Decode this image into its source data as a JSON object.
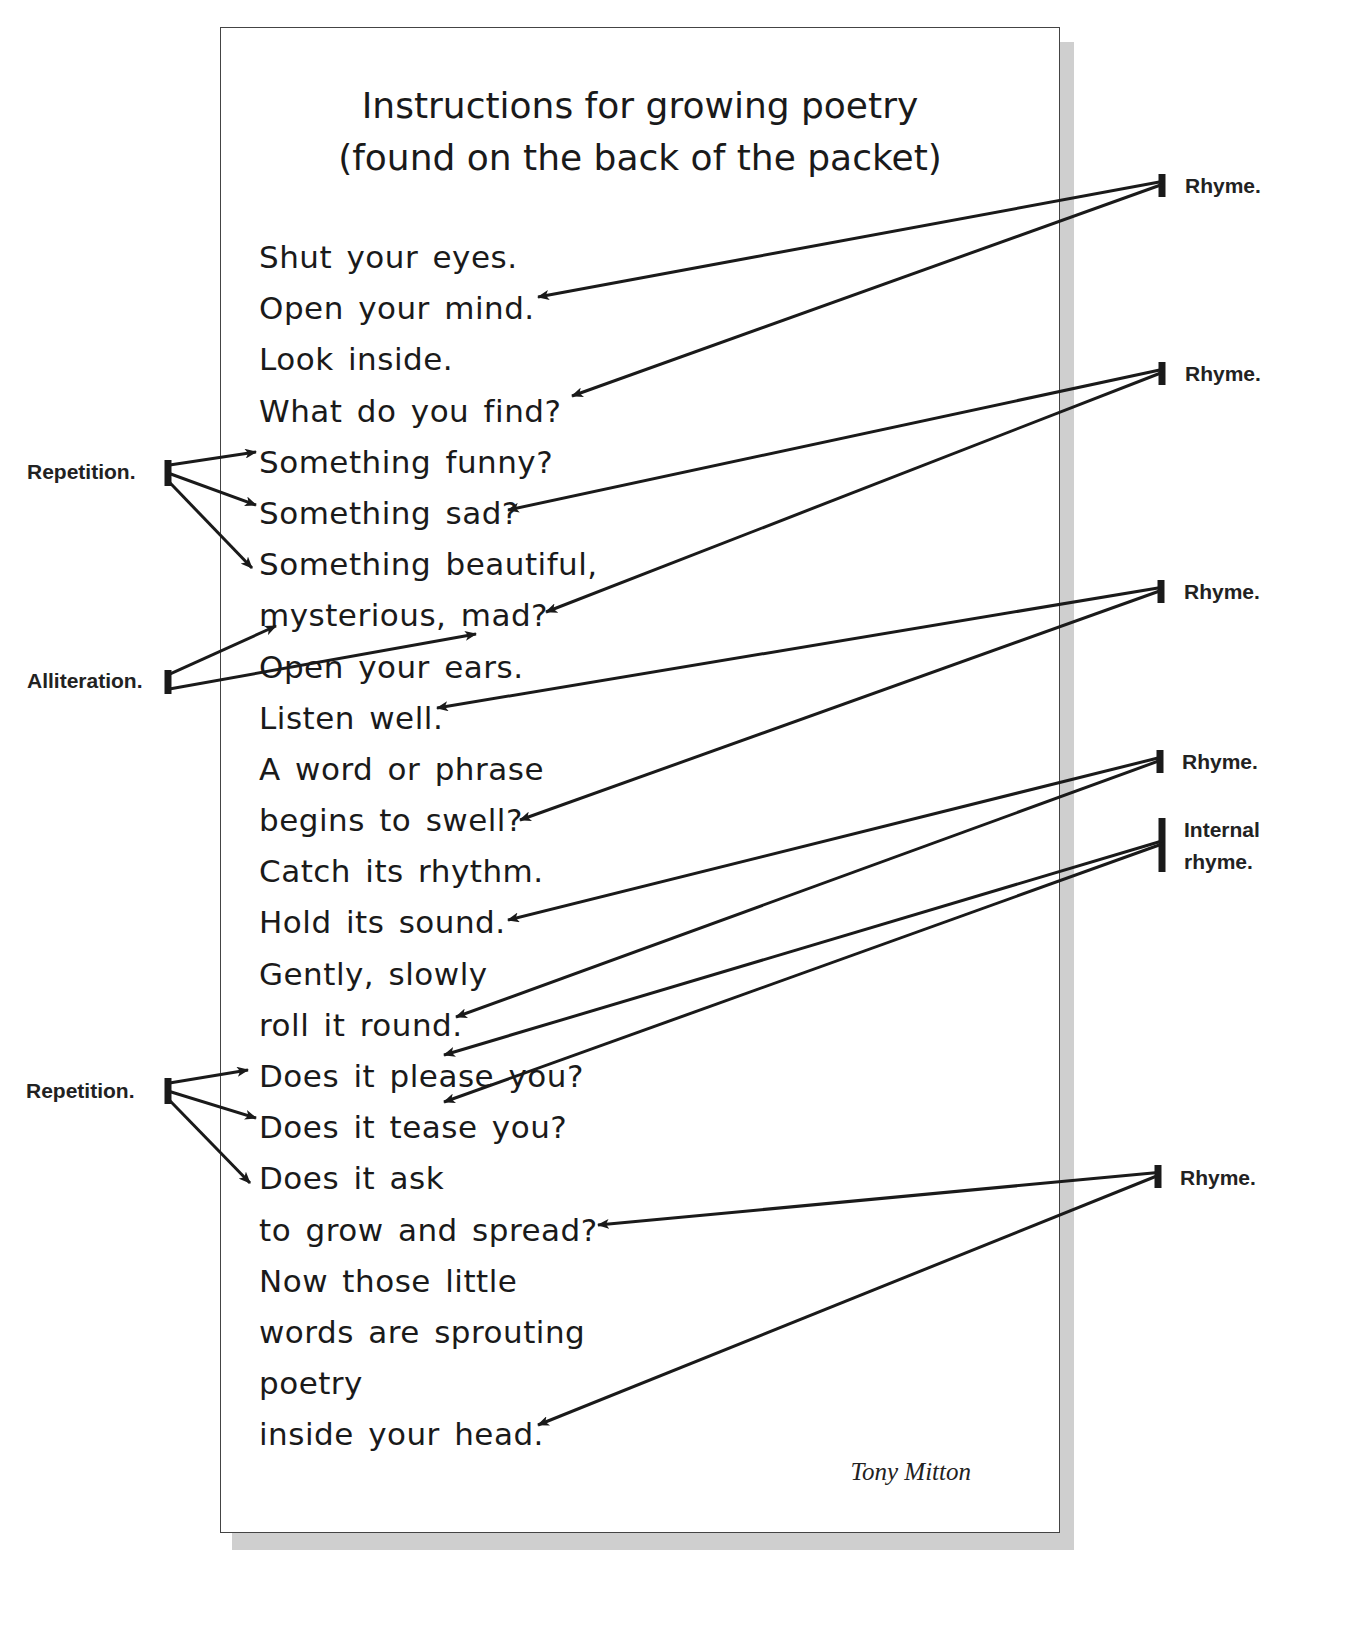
{
  "page": {
    "title_line1": "Instructions for growing poetry",
    "title_line2": "(found on the back of the packet)",
    "author": "Tony Mitton",
    "colors": {
      "ink": "#1a1a1a",
      "border": "#444444",
      "shadow": "#cfcfcf",
      "background": "#ffffff"
    }
  },
  "poem": {
    "lines": [
      "Shut your eyes.",
      "Open your mind.",
      "Look inside.",
      "What do you find?",
      "Something funny?",
      "Something sad?",
      "Something beautiful,",
      "mysterious, mad?",
      "Open your ears.",
      "Listen well.",
      "A word or phrase",
      "begins to swell?",
      "Catch its rhythm.",
      "Hold its sound.",
      "Gently, slowly",
      "roll it round.",
      "Does it please you?",
      "Does it tease you?",
      "Does it ask",
      "to grow and spread?",
      "Now those little",
      "words are sprouting",
      "poetry",
      "inside your head."
    ]
  },
  "annotations": {
    "right": [
      {
        "label": "Rhyme.",
        "x": 1185,
        "y": 170,
        "bar": [
          1162,
          174,
          1162,
          197
        ],
        "targets": [
          [
            538,
            297
          ],
          [
            572,
            396
          ]
        ]
      },
      {
        "label": "Rhyme.",
        "x": 1185,
        "y": 358,
        "bar": [
          1162,
          362,
          1162,
          385
        ],
        "targets": [
          [
            508,
            510
          ],
          [
            546,
            612
          ]
        ]
      },
      {
        "label": "Rhyme.",
        "x": 1184,
        "y": 576,
        "bar": [
          1161,
          580,
          1161,
          603
        ],
        "targets": [
          [
            437,
            708
          ],
          [
            520,
            820
          ]
        ]
      },
      {
        "label": "Rhyme.",
        "x": 1182,
        "y": 746,
        "bar": [
          1160,
          750,
          1160,
          773
        ],
        "targets": [
          [
            508,
            920
          ],
          [
            456,
            1017
          ]
        ]
      },
      {
        "label": "Internal rhyme.",
        "label_line1": "Internal",
        "label_line2": "rhyme.",
        "x": 1184,
        "y": 814,
        "bar": [
          1162,
          818,
          1162,
          872
        ],
        "targets": [
          [
            444,
            1055
          ],
          [
            444,
            1102
          ]
        ]
      },
      {
        "label": "Rhyme.",
        "x": 1180,
        "y": 1162,
        "bar": [
          1158,
          1165,
          1158,
          1188
        ],
        "targets": [
          [
            598,
            1225
          ],
          [
            538,
            1425
          ]
        ]
      }
    ],
    "left": [
      {
        "label": "Repetition.",
        "x": 27,
        "y": 456,
        "bar": [
          168,
          460,
          168,
          486
        ],
        "targets": [
          [
            256,
            452
          ],
          [
            256,
            505
          ],
          [
            252,
            568
          ]
        ]
      },
      {
        "label": "Alliteration.",
        "x": 27,
        "y": 665,
        "bar": [
          168,
          670,
          168,
          694
        ],
        "targets": [
          [
            276,
            626
          ],
          [
            476,
            634
          ]
        ]
      },
      {
        "label": "Repetition.",
        "x": 26,
        "y": 1075,
        "bar": [
          168,
          1078,
          168,
          1104
        ],
        "targets": [
          [
            248,
            1070
          ],
          [
            256,
            1118
          ],
          [
            250,
            1183
          ]
        ]
      }
    ]
  }
}
